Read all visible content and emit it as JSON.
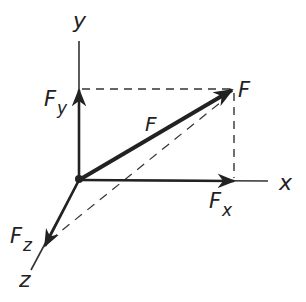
{
  "diagram": {
    "axes": {
      "x": {
        "label": "x"
      },
      "y": {
        "label": "y"
      },
      "z": {
        "label": "z"
      }
    },
    "vectors": {
      "F": {
        "label": "F",
        "tip_label": "F"
      },
      "Fx": {
        "label": "F",
        "sub": "x"
      },
      "Fy": {
        "label": "F",
        "sub": "y"
      },
      "Fz": {
        "label": "F",
        "sub": "z"
      }
    },
    "colors": {
      "ink": "#222222",
      "dash": "#333333",
      "background": "#ffffff"
    }
  }
}
